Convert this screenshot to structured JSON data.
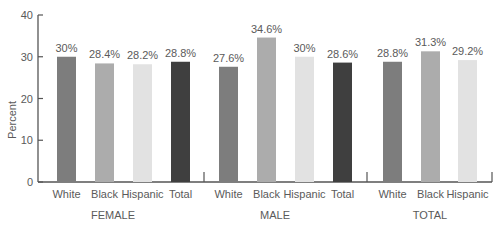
{
  "chart_data": {
    "type": "bar",
    "title": "",
    "xlabel": "",
    "ylabel": "Percent",
    "ylim": [
      0,
      40
    ],
    "yticks": [
      0,
      10,
      20,
      30,
      40
    ],
    "grid": false,
    "legend": null,
    "groups": [
      {
        "name": "FEMALE",
        "categories": [
          "White",
          "Black",
          "Hispanic",
          "Total"
        ],
        "values": [
          30,
          28.4,
          28.2,
          28.8
        ],
        "labels": [
          "30%",
          "28.4%",
          "28.2%",
          "28.8%"
        ]
      },
      {
        "name": "MALE",
        "categories": [
          "White",
          "Black",
          "Hispanic",
          "Total"
        ],
        "values": [
          27.6,
          34.6,
          30,
          28.6
        ],
        "labels": [
          "27.6%",
          "34.6%",
          "30%",
          "28.6%"
        ]
      },
      {
        "name": "TOTAL",
        "categories": [
          "White",
          "Black",
          "Hispanic"
        ],
        "values": [
          28.8,
          31.3,
          29.2
        ],
        "labels": [
          "28.8%",
          "31.3%",
          "29.2%"
        ]
      }
    ],
    "category_colors": {
      "White": "#7d7d7d",
      "Black": "#acacac",
      "Hispanic": "#e2e2e2",
      "Total": "#3f3f3f"
    }
  }
}
